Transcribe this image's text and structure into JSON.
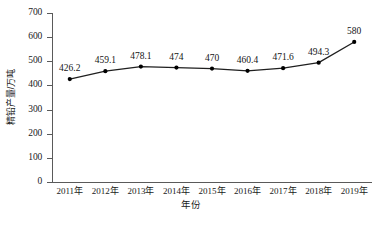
{
  "chart_data": {
    "type": "line",
    "title": "",
    "xlabel": "年份",
    "ylabel": "精铅产量/万吨",
    "categories": [
      "2011年",
      "2012年",
      "2013年",
      "2014年",
      "2015年",
      "2016年",
      "2017年",
      "2018年",
      "2019年"
    ],
    "values": [
      426.2,
      459.1,
      478.1,
      474,
      470,
      460.4,
      471.6,
      494.3,
      580
    ],
    "point_labels": [
      "426.2",
      "459.1",
      "478.1",
      "474",
      "470",
      "460.4",
      "471.6",
      "494.3",
      "580"
    ],
    "ylim": [
      0,
      700
    ],
    "ytick_values": [
      0,
      100,
      200,
      300,
      400,
      500,
      600,
      700
    ],
    "ytick_labels": [
      "0",
      "100",
      "200",
      "300",
      "400",
      "500",
      "600",
      "700"
    ],
    "grid": false,
    "legend": "none",
    "series": [
      {
        "name": "精铅产量",
        "values": [
          426.2,
          459.1,
          478.1,
          474,
          470,
          460.4,
          471.6,
          494.3,
          580
        ],
        "line_color": "#1f1f1f",
        "marker": "circle",
        "marker_color": "#000000"
      }
    ]
  },
  "caption": {
    "text": "",
    "note": "cut-off-at-image-bottom"
  },
  "colors": {
    "axis": "#5a5a5a",
    "line": "#1f1f1f",
    "marker": "#000000",
    "text": "#1a1a1a",
    "background": "#ffffff"
  }
}
